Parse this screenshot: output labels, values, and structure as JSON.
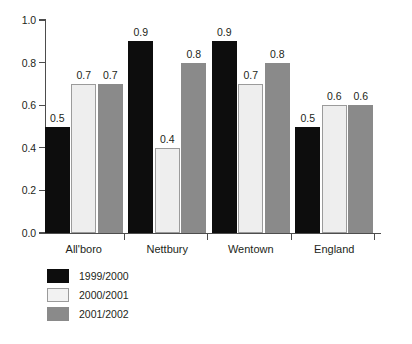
{
  "chart_data": {
    "type": "bar",
    "title": "",
    "subtitle": "",
    "xlabel": "",
    "ylabel": "",
    "ylim": [
      0.0,
      1.0
    ],
    "ytick_labels": [
      "0.0",
      "0.2",
      "0.4",
      "0.6",
      "0.8",
      "1.0"
    ],
    "ytick_values": [
      0.0,
      0.2,
      0.4,
      0.6,
      0.8,
      1.0
    ],
    "grid": false,
    "legend_position": "bottom-left",
    "categories": [
      "All'boro",
      "Nettbury",
      "Wentown",
      "England"
    ],
    "series": [
      {
        "name": "1999/2000",
        "color": "#0d0d0d",
        "values": [
          0.5,
          0.9,
          0.9,
          0.5
        ],
        "labels": [
          "0.5",
          "0.9",
          "0.9",
          "0.5"
        ]
      },
      {
        "name": "2000/2001",
        "color": "#eeeeee",
        "values": [
          0.7,
          0.4,
          0.7,
          0.6
        ],
        "labels": [
          "0.7",
          "0.4",
          "0.7",
          "0.6"
        ]
      },
      {
        "name": "2001/2002",
        "color": "#8a8a8a",
        "values": [
          0.7,
          0.8,
          0.8,
          0.6
        ],
        "labels": [
          "0.7",
          "0.8",
          "0.8",
          "0.6"
        ]
      }
    ]
  },
  "legend": {
    "entries": [
      {
        "label": "1999/2000"
      },
      {
        "label": "2000/2001"
      },
      {
        "label": "2001/2002"
      }
    ]
  }
}
